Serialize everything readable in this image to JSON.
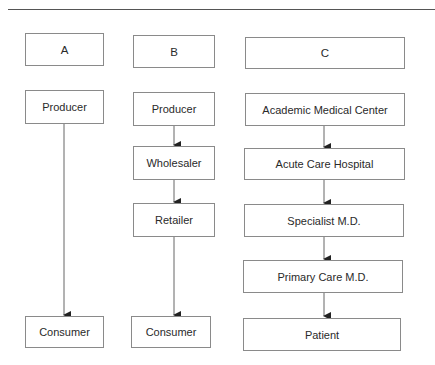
{
  "diagram": {
    "columns": [
      {
        "header": "A",
        "nodes": [
          "Producer",
          "Consumer"
        ]
      },
      {
        "header": "B",
        "nodes": [
          "Producer",
          "Wholesaler",
          "Retailer",
          "Consumer"
        ]
      },
      {
        "header": "C",
        "nodes": [
          "Academic Medical Center",
          "Acute Care Hospital",
          "Specialist M.D.",
          "Primary Care M.D.",
          "Patient"
        ]
      }
    ],
    "edges": [
      {
        "from": "A.Producer",
        "to": "A.Consumer"
      },
      {
        "from": "B.Producer",
        "to": "B.Wholesaler"
      },
      {
        "from": "B.Wholesaler",
        "to": "B.Retailer"
      },
      {
        "from": "B.Retailer",
        "to": "B.Consumer"
      },
      {
        "from": "C.Academic Medical Center",
        "to": "C.Acute Care Hospital"
      },
      {
        "from": "C.Acute Care Hospital",
        "to": "C.Specialist M.D."
      },
      {
        "from": "C.Specialist M.D.",
        "to": "C.Primary Care M.D."
      },
      {
        "from": "C.Primary Care M.D.",
        "to": "C.Patient"
      }
    ],
    "colors": {
      "line": "#555555",
      "border": "#8a8a8a",
      "text": "#2a2a2a"
    }
  }
}
